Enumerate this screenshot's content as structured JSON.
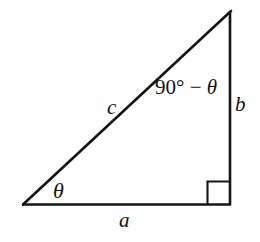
{
  "figure": {
    "name": "right-triangle-trigonometry-diagram",
    "background_color": "#ffffff",
    "stroke_color": "#111111",
    "width": 260,
    "height": 242,
    "geometry": {
      "vertices": {
        "bottom_left": [
          23,
          205
        ],
        "bottom_right": [
          230,
          205
        ],
        "apex": [
          231,
          11
        ]
      },
      "right_angle_marker": {
        "x": 207,
        "y": 181,
        "size": 23,
        "at_vertex": "bottom_right"
      },
      "sides": {
        "adjacent_label": "a",
        "opposite_label": "b",
        "hypotenuse_label": "c"
      }
    }
  },
  "labels": {
    "theta": "θ",
    "hypotenuse": "c",
    "opposite": "b",
    "adjacent": "a",
    "complement_prefix": "90° − ",
    "complement_theta": "θ",
    "complement_full": "90° − θ"
  }
}
